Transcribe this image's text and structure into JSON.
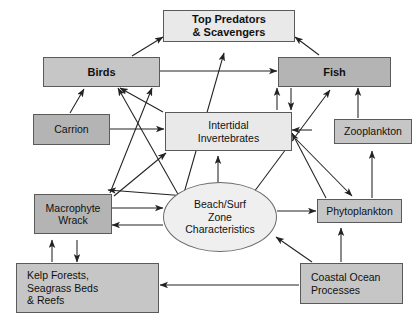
{
  "figure": {
    "kind": "conceptual-food-web-diagram",
    "background": "#ffffff",
    "colors": {
      "light_fill": "#e9e9e9",
      "mid_fill": "#c6c6c6",
      "dark_fill": "#b4b4b4",
      "ellipse_fill": "#efefef",
      "stroke": "#5a5a5a",
      "arrow": "#222222",
      "text": "#111111"
    }
  },
  "nodes": {
    "top_predators": {
      "label": "Top Predators\n& Scavengers",
      "line1": "Top Predators",
      "line2": "& Scavengers",
      "shade": "light",
      "bold": true
    },
    "birds": {
      "label": "Birds",
      "shade": "mid",
      "bold": true
    },
    "fish": {
      "label": "Fish",
      "shade": "dark",
      "bold": true
    },
    "carrion": {
      "label": "Carrion",
      "shade": "dark",
      "bold": false
    },
    "intertidal": {
      "label": "Intertidal\nInvertebrates",
      "line1": "Intertidal",
      "line2": "Invertebrates",
      "shade": "light",
      "bold": false
    },
    "zooplankton": {
      "label": "Zooplankton",
      "shade": "mid",
      "bold": false
    },
    "macrophyte": {
      "label": "Macrophyte\nWrack",
      "line1": "Macrophyte",
      "line2": "Wrack",
      "shade": "dark",
      "bold": false
    },
    "beach_surf": {
      "label": "Beach/Surf\nZone\nCharacteristics",
      "line1": "Beach/Surf",
      "line2": "Zone",
      "line3": "Characteristics",
      "shade": "ellipse",
      "bold": false
    },
    "phytoplankton": {
      "label": "Phytoplankton",
      "shade": "mid",
      "bold": false
    },
    "kelp": {
      "label": "Kelp Forests,\nSeagrass Beds\n& Reefs",
      "line1": "Kelp Forests,",
      "line2": "Seagrass Beds",
      "line3": "& Reefs",
      "shade": "mid",
      "bold": false
    },
    "coastal_ocean": {
      "label": "Coastal Ocean\nProcesses",
      "line1": "Coastal Ocean",
      "line2": "Processes",
      "shade": "mid",
      "bold": false
    }
  },
  "edges": [
    {
      "from": "birds",
      "to": "top_predators",
      "style": "solid"
    },
    {
      "from": "fish",
      "to": "top_predators",
      "style": "solid"
    },
    {
      "from": "birds",
      "to": "fish",
      "style": "solid"
    },
    {
      "from": "carrion",
      "to": "birds",
      "style": "solid"
    },
    {
      "from": "carrion",
      "to": "intertidal",
      "style": "solid"
    },
    {
      "from": "intertidal",
      "to": "birds",
      "style": "solid"
    },
    {
      "from": "intertidal",
      "to": "fish",
      "style": "solid"
    },
    {
      "from": "fish",
      "to": "intertidal",
      "style": "solid"
    },
    {
      "from": "beach_surf",
      "to": "top_predators",
      "style": "solid"
    },
    {
      "from": "beach_surf",
      "to": "birds",
      "style": "solid"
    },
    {
      "from": "beach_surf",
      "to": "intertidal",
      "style": "solid"
    },
    {
      "from": "beach_surf",
      "to": "fish",
      "style": "solid"
    },
    {
      "from": "beach_surf",
      "to": "carrion",
      "style": "solid"
    },
    {
      "from": "beach_surf",
      "to": "macrophyte",
      "style": "solid"
    },
    {
      "from": "macrophyte",
      "to": "beach_surf",
      "style": "solid"
    },
    {
      "from": "beach_surf",
      "to": "phytoplankton",
      "style": "solid"
    },
    {
      "from": "macrophyte",
      "to": "intertidal",
      "style": "solid"
    },
    {
      "from": "macrophyte",
      "to": "birds",
      "style": "solid"
    },
    {
      "from": "phytoplankton",
      "to": "zooplankton",
      "style": "solid"
    },
    {
      "from": "phytoplankton",
      "to": "fish",
      "style": "solid"
    },
    {
      "from": "zooplankton",
      "to": "fish",
      "style": "solid"
    },
    {
      "from": "kelp",
      "to": "macrophyte",
      "style": "solid"
    },
    {
      "from": "macrophyte",
      "to": "kelp",
      "style": "solid"
    },
    {
      "from": "coastal_ocean",
      "to": "kelp",
      "style": "solid"
    },
    {
      "from": "coastal_ocean",
      "to": "beach_surf",
      "style": "solid"
    },
    {
      "from": "coastal_ocean",
      "to": "phytoplankton",
      "style": "solid"
    }
  ]
}
